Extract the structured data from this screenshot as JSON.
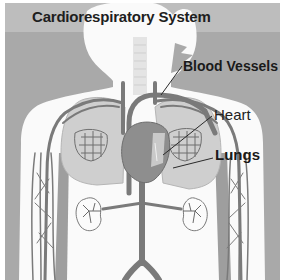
{
  "diagram": {
    "title": "Cardiorespiratory System",
    "labels": {
      "blood_vessels": "Blood Vessels",
      "heart": "Heart",
      "lungs": "Lungs"
    },
    "colors": {
      "panel_background": "#a9a9a9",
      "title_bar": "#bdbdbd",
      "body_silhouette": "#fafafa",
      "vessels": "#7a7a7a",
      "heart": "#8a8a8a",
      "lungs": "#c9c9c9",
      "text": "#1e1e1e"
    }
  }
}
